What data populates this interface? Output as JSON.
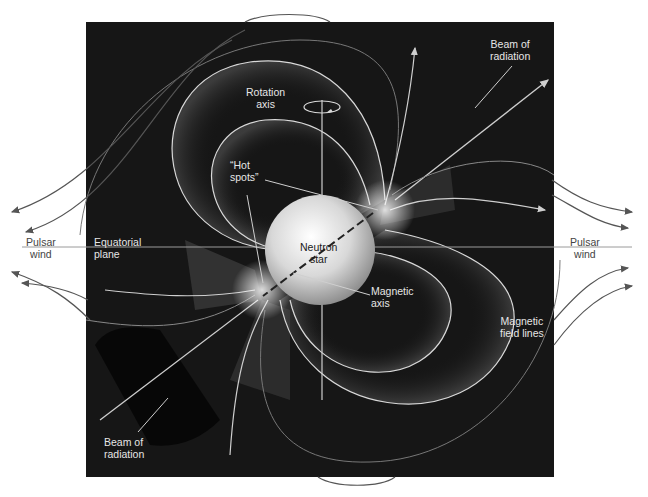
{
  "figure": {
    "colors": {
      "background": "#ffffff",
      "panel": "#161616",
      "field_line": "#d9d9d9",
      "wind_arrow": "#555555",
      "star": "#e8e8e8"
    }
  },
  "labels": {
    "rotation_axis": [
      "Rotation",
      "axis"
    ],
    "beam_top": [
      "Beam of",
      "radiation"
    ],
    "hot_spots": [
      "“Hot",
      "spots”"
    ],
    "neutron_star": [
      "Neutron",
      "star"
    ],
    "magnetic_axis": [
      "Magnetic",
      "axis"
    ],
    "magnetic_field_lines": [
      "Magnetic",
      "field lines"
    ],
    "equatorial_plane": [
      "Equatorial",
      "plane"
    ],
    "pulsar_wind_left": [
      "Pulsar",
      "wind"
    ],
    "pulsar_wind_right": [
      "Pulsar",
      "wind"
    ],
    "beam_bottom": [
      "Beam of",
      "radiation"
    ]
  }
}
